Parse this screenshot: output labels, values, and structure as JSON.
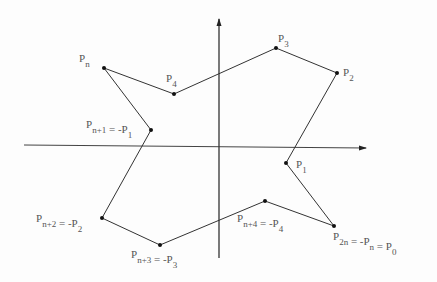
{
  "diagram": {
    "axes": {
      "x_axis": {
        "x1": 24,
        "y1": 145,
        "x2": 366,
        "y2": 148
      },
      "y_axis": {
        "x1": 219,
        "y1": 258,
        "x2": 219,
        "y2": 19
      }
    },
    "colors": {
      "line": "#333333",
      "text": "#555555",
      "point": "#111111"
    },
    "vertices": [
      {
        "id": "Pn",
        "x": 104,
        "y": 68
      },
      {
        "id": "P4",
        "x": 174,
        "y": 94
      },
      {
        "id": "P3",
        "x": 276,
        "y": 48
      },
      {
        "id": "P2",
        "x": 337,
        "y": 73
      },
      {
        "id": "P1",
        "x": 286,
        "y": 163
      },
      {
        "id": "P0",
        "x": 334,
        "y": 226
      },
      {
        "id": "-P4",
        "x": 265,
        "y": 201
      },
      {
        "id": "-P3",
        "x": 160,
        "y": 245
      },
      {
        "id": "-P2",
        "x": 102,
        "y": 218
      },
      {
        "id": "-P1",
        "x": 151,
        "y": 130
      }
    ],
    "labels": [
      {
        "id": "label-pn",
        "base": "P",
        "sub": "n",
        "rest": "",
        "rest_sub": "",
        "x": 79,
        "y": 62
      },
      {
        "id": "label-p4",
        "base": "P",
        "sub": "4",
        "rest": "",
        "rest_sub": "",
        "x": 166,
        "y": 82
      },
      {
        "id": "label-p3",
        "base": "P",
        "sub": "3",
        "rest": "",
        "rest_sub": "",
        "x": 278,
        "y": 42
      },
      {
        "id": "label-p2",
        "base": "P",
        "sub": "2",
        "rest": "",
        "rest_sub": "",
        "x": 343,
        "y": 76
      },
      {
        "id": "label-p1",
        "base": "P",
        "sub": "1",
        "rest": "",
        "rest_sub": "",
        "x": 296,
        "y": 168
      },
      {
        "id": "label-pn1",
        "base": "P",
        "sub": "n+1",
        "rest": " =  -P",
        "rest_sub": "1",
        "x": 86,
        "y": 128
      },
      {
        "id": "label-pn2",
        "base": "P",
        "sub": "n+2",
        "rest": " =  -P",
        "rest_sub": "2",
        "x": 36,
        "y": 222
      },
      {
        "id": "label-pn3",
        "base": "P",
        "sub": "n+3",
        "rest": " =  -P",
        "rest_sub": "3",
        "x": 131,
        "y": 258
      },
      {
        "id": "label-pn4",
        "base": "P",
        "sub": "n+4",
        "rest": " =  -P",
        "rest_sub": "4",
        "x": 237,
        "y": 222
      },
      {
        "id": "label-p2n",
        "base": "P",
        "sub": "2n",
        "rest": " =  -P",
        "rest_sub": "n",
        "x": 333,
        "y": 240,
        "tail": " =  P",
        "tail_sub": "0"
      }
    ]
  }
}
